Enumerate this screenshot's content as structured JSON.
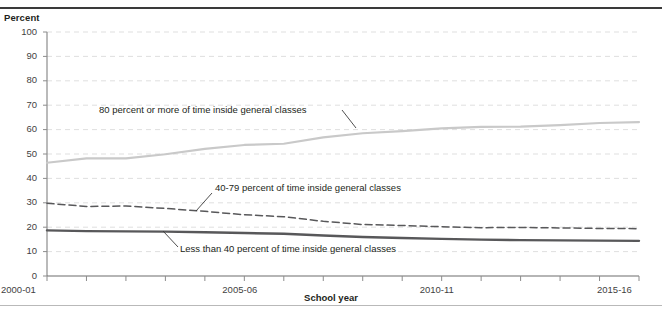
{
  "chart_data": {
    "type": "line",
    "title": "",
    "xlabel": "School year",
    "ylabel": "Percent",
    "ylim": [
      0,
      100
    ],
    "ytick_values": [
      0,
      10,
      20,
      30,
      40,
      50,
      60,
      70,
      80,
      90,
      100
    ],
    "ytick_labels": [
      "0",
      "10",
      "20",
      "30",
      "40",
      "50",
      "60",
      "70",
      "80",
      "90",
      "100"
    ],
    "grid": true,
    "grid_axis": "y",
    "legend": "none",
    "x": [
      "2000-01",
      "2001-02",
      "2002-03",
      "2003-04",
      "2004-05",
      "2005-06",
      "2006-07",
      "2007-08",
      "2008-09",
      "2009-10",
      "2010-11",
      "2011-12",
      "2012-13",
      "2013-14",
      "2014-15",
      "2015-16"
    ],
    "xtick_labels_shown": [
      "2000-01",
      "2005-06",
      "2010-11",
      "2015-16"
    ],
    "xtick_label_indices": [
      0,
      5,
      10,
      15
    ],
    "series": [
      {
        "name": "80 percent or more of time inside general classes",
        "style": "solid",
        "color": "#c9c9c9",
        "width": 2.2,
        "values": [
          46.4,
          48.2,
          48.2,
          49.9,
          52.1,
          53.7,
          54.2,
          56.8,
          58.5,
          59.4,
          60.5,
          61.1,
          61.2,
          61.8,
          62.7,
          63.1
        ]
      },
      {
        "name": "40-79 percent of time inside general classes",
        "style": "dashed",
        "color": "#58585a",
        "width": 1.5,
        "values": [
          29.8,
          28.5,
          28.7,
          27.7,
          26.5,
          25.1,
          24.3,
          22.4,
          21.1,
          20.7,
          20.2,
          19.8,
          19.9,
          19.7,
          19.5,
          19.4
        ]
      },
      {
        "name": "Less than 40 percent of time inside general classes",
        "style": "solid",
        "color": "#58585a",
        "width": 2.4,
        "values": [
          18.7,
          18.4,
          18.3,
          18.2,
          17.9,
          17.6,
          17.3,
          16.6,
          16.0,
          15.6,
          15.2,
          14.9,
          14.7,
          14.6,
          14.5,
          14.4
        ]
      }
    ],
    "annotations": [
      {
        "text": "80 percent or more of time inside general classes",
        "target_series": 0
      },
      {
        "text": "40-79 percent of time inside general classes",
        "target_series": 1
      },
      {
        "text": "Less than 40 percent of time inside general classes",
        "target_series": 2
      }
    ]
  },
  "axes": {
    "y_title": "Percent",
    "x_title": "School year"
  }
}
